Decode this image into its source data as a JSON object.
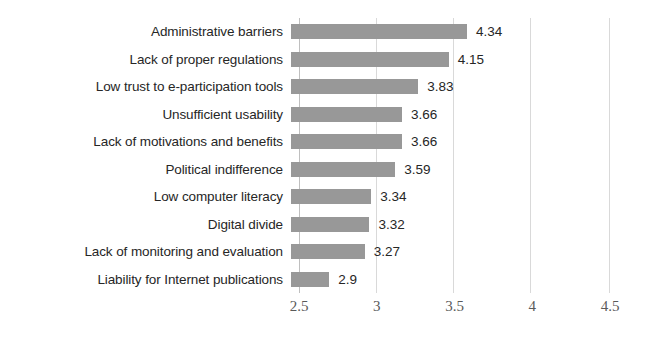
{
  "chart_data": {
    "type": "bar",
    "orientation": "horizontal",
    "title": "",
    "xlabel": "",
    "ylabel": "",
    "xlim": [
      2.5,
      4.5
    ],
    "xticks": [
      "2.5",
      "3",
      "3.5",
      "4",
      "4.5"
    ],
    "grid": true,
    "legend": false,
    "bar_color": "#989898",
    "gridline_color": "#d9d9d9",
    "categories": [
      "Administrative barriers",
      "Lack of proper regulations",
      "Low trust to e-participation tools",
      "Unsufficient usability",
      "Lack of motivations and benefits",
      "Political indifference",
      "Low computer literacy",
      "Digital divide",
      "Lack of monitoring and evaluation",
      "Liability for Internet publications"
    ],
    "values": [
      4.34,
      4.15,
      3.83,
      3.66,
      3.66,
      3.59,
      3.34,
      3.32,
      3.27,
      2.9
    ],
    "value_labels": [
      "4.34",
      "4.15",
      "3.83",
      "3.66",
      "3.66",
      "3.59",
      "3.34",
      "3.32",
      "3.27",
      "2.9"
    ]
  }
}
